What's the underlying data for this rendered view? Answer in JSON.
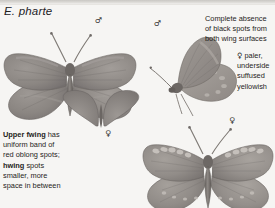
{
  "page": {
    "background_color": "#f6f5f3",
    "ink_color": "#1f1d1b"
  },
  "header": {
    "species_label": "E. pharte"
  },
  "symbols": {
    "male": "♂",
    "female": "♀"
  },
  "specimens": [
    {
      "id": "male-upperside",
      "sex_symbol": "♂",
      "view": "upperside",
      "position": "top-left"
    },
    {
      "id": "male-underside",
      "sex_symbol": "♂",
      "view": "underside",
      "position": "top-right"
    },
    {
      "id": "female-upperside-small",
      "sex_symbol": "♀",
      "view": "upperside",
      "position": "middle-left"
    },
    {
      "id": "female-upperside",
      "sex_symbol": "♀",
      "view": "upperside",
      "position": "bottom-right"
    }
  ],
  "annotations": {
    "absence_note": {
      "lines": [
        "Complete absence",
        "of black spots from",
        "both wing surfaces"
      ],
      "text": "Complete absence of black spots from both wing surfaces"
    },
    "female_note": {
      "symbol": "♀",
      "lines": [
        "paler,",
        "underside",
        "suffused",
        "yellowish"
      ],
      "text": "♀ paler, underside suffused yellowish"
    },
    "upper_forewing_note": {
      "bold_lead": "Upper fwing",
      "rest_a": " has uniform band of red oblong spots; ",
      "bold_mid": "hwing",
      "rest_b": " spots smaller, more space in between",
      "text": "Upper fwing has uniform band of red oblong spots; hwing spots smaller, more space in between"
    }
  }
}
